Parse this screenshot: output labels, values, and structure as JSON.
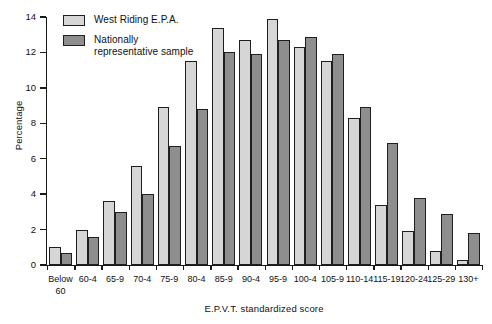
{
  "chart_data": {
    "type": "bar",
    "title": "",
    "xlabel": "E.P.V.T. standardized score",
    "ylabel": "Percentage",
    "ylim": [
      0,
      14
    ],
    "yticks": [
      0,
      2,
      4,
      6,
      8,
      10,
      12,
      14
    ],
    "grid": false,
    "legend_position": "top-left",
    "categories": [
      "Below\n60",
      "60-4",
      "65-9",
      "70-4",
      "75-9",
      "80-4",
      "85-9",
      "90-4",
      "95-9",
      "100-4",
      "105-9",
      "110-14",
      "115-19",
      "120-24",
      "125-29",
      "130+"
    ],
    "series": [
      {
        "name": "West Riding E.P.A.",
        "color": "#d6d6d6",
        "values": [
          1.0,
          2.0,
          3.6,
          5.6,
          8.9,
          11.5,
          13.4,
          12.7,
          13.9,
          12.3,
          11.5,
          8.3,
          3.4,
          1.9,
          0.8,
          0.3
        ]
      },
      {
        "name": "Nationally\nrepresentative sample",
        "color": "#8e8e8e",
        "values": [
          0.7,
          1.6,
          3.0,
          4.0,
          6.7,
          8.8,
          12.0,
          11.9,
          12.7,
          12.9,
          11.9,
          8.9,
          6.9,
          3.8,
          2.9,
          1.8
        ]
      }
    ]
  }
}
